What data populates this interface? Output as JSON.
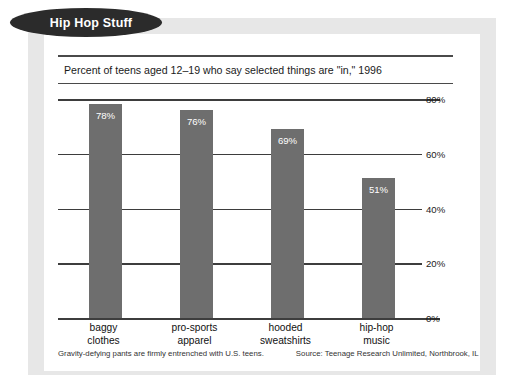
{
  "badge": {
    "label": "Hip Hop Stuff"
  },
  "chart_data": {
    "type": "bar",
    "title": "Hip Hop Stuff",
    "subtitle": "Percent of teens aged 12–19 who say selected things are \"in,\" 1996",
    "categories": [
      "baggy clothes",
      "pro-sports apparel",
      "hooded sweatshirts",
      "hip-hop music"
    ],
    "category_lines": [
      [
        "baggy",
        "clothes"
      ],
      [
        "pro-sports",
        "apparel"
      ],
      [
        "hooded",
        "sweatshirts"
      ],
      [
        "hip-hop",
        "music"
      ]
    ],
    "values": [
      78,
      76,
      69,
      51
    ],
    "value_labels": [
      "78%",
      "76%",
      "69%",
      "51%"
    ],
    "xlabel": "",
    "ylabel": "",
    "ylim": [
      0,
      80
    ],
    "yticks": [
      80,
      60,
      40,
      20,
      0
    ],
    "ytick_labels": [
      "80%",
      "60%",
      "40%",
      "20%",
      "0%"
    ],
    "grid": true,
    "legend": false,
    "bar_color": "#6e6e6e",
    "value_label_color": "#ffffff"
  },
  "footer": {
    "note": "Gravity-defying pants are firmly entrenched with U.S. teens.",
    "source": "Source: Teenage Research Unlimited, Northbrook, IL"
  }
}
